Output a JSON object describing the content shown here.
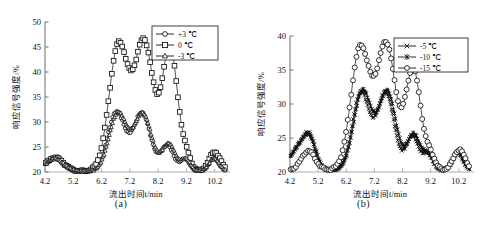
{
  "figure": {
    "panels": [
      {
        "id": "a",
        "caption": "(a)",
        "xlabel": "流出时间t/min",
        "ylabel": "响应信号强度/%",
        "xticks": [
          "4.2",
          "5.2",
          "6.2",
          "7.2",
          "8.2",
          "9.2",
          "10.2"
        ],
        "yticks": [
          "20",
          "25",
          "30",
          "35",
          "40",
          "45",
          "50"
        ],
        "legend": [
          {
            "label": "+3 ℃",
            "marker": "circle"
          },
          {
            "label": "0 ℃",
            "marker": "square"
          },
          {
            "label": "-3 ℃",
            "marker": "triangle"
          }
        ]
      },
      {
        "id": "b",
        "caption": "(b)",
        "xlabel": "流出时间t/min",
        "ylabel": "响应信号强度/%",
        "xticks": [
          "4.2",
          "5.2",
          "6.2",
          "7.2",
          "8.2",
          "9.2",
          "10.2"
        ],
        "yticks": [
          "20",
          "25",
          "30",
          "35",
          "40"
        ],
        "legend": [
          {
            "label": "-5 ℃",
            "marker": "cross"
          },
          {
            "label": "-10 ℃",
            "marker": "star"
          },
          {
            "label": "-15 ℃",
            "marker": "circle"
          }
        ]
      }
    ]
  },
  "chart_data": [
    {
      "type": "line",
      "panel": "(a)",
      "title": "",
      "xlabel": "流出时间t/min",
      "ylabel": "响应信号强度/%",
      "xlim": [
        4.2,
        10.6
      ],
      "ylim": [
        20,
        50
      ],
      "xticks": [
        4.2,
        5.2,
        6.2,
        7.2,
        8.2,
        9.2,
        10.2
      ],
      "yticks": [
        20,
        25,
        30,
        35,
        40,
        45,
        50
      ],
      "grid": false,
      "legend_position": "top-right",
      "baseline": 20.2,
      "series": [
        {
          "name": "+3 ℃",
          "marker": "circle",
          "peaks": [
            {
              "center": 6.72,
              "height": 11.8,
              "width": 0.3
            },
            {
              "center": 7.62,
              "height": 11.6,
              "width": 0.3
            },
            {
              "center": 8.52,
              "height": 5.1,
              "width": 0.22
            }
          ],
          "bumps": [
            {
              "center": 4.55,
              "height": 2.6,
              "width": 0.3
            },
            {
              "center": 9.15,
              "height": 2.4,
              "width": 0.16
            },
            {
              "center": 10.15,
              "height": 2.6,
              "width": 0.18
            }
          ]
        },
        {
          "name": "0 ℃",
          "marker": "square",
          "peaks": [
            {
              "center": 6.8,
              "height": 25.2,
              "width": 0.33
            },
            {
              "center": 7.7,
              "height": 25.8,
              "width": 0.33
            },
            {
              "center": 8.62,
              "height": 24.6,
              "width": 0.27
            }
          ],
          "bumps": [
            {
              "center": 4.55,
              "height": 2.7,
              "width": 0.3
            },
            {
              "center": 9.2,
              "height": 2.5,
              "width": 0.16
            },
            {
              "center": 10.2,
              "height": 3.8,
              "width": 0.2
            }
          ]
        },
        {
          "name": "-3 ℃",
          "marker": "triangle",
          "peaks": [
            {
              "center": 6.78,
              "height": 11.6,
              "width": 0.31
            },
            {
              "center": 7.66,
              "height": 11.4,
              "width": 0.31
            },
            {
              "center": 8.58,
              "height": 5.4,
              "width": 0.23
            }
          ],
          "bumps": [
            {
              "center": 4.55,
              "height": 2.5,
              "width": 0.3
            },
            {
              "center": 9.18,
              "height": 2.3,
              "width": 0.16
            },
            {
              "center": 10.18,
              "height": 2.5,
              "width": 0.18
            }
          ]
        }
      ]
    },
    {
      "type": "line",
      "panel": "(b)",
      "title": "",
      "xlabel": "流出时间t/min",
      "ylabel": "响应信号强度/%",
      "xlim": [
        4.2,
        10.6
      ],
      "ylim": [
        20,
        40
      ],
      "xticks": [
        4.2,
        5.2,
        6.2,
        7.2,
        8.2,
        9.2,
        10.2
      ],
      "yticks": [
        20,
        25,
        30,
        35,
        40
      ],
      "grid": false,
      "legend_position": "top-right",
      "baseline": 20.3,
      "series": [
        {
          "name": "-5 ℃",
          "marker": "cross",
          "peaks": [
            {
              "center": 6.72,
              "height": 11.4,
              "width": 0.3
            },
            {
              "center": 7.6,
              "height": 11.3,
              "width": 0.3
            },
            {
              "center": 8.55,
              "height": 5.0,
              "width": 0.22
            }
          ],
          "bumps": [
            {
              "center": 4.9,
              "height": 4.8,
              "width": 0.22
            },
            {
              "center": 4.45,
              "height": 2.9,
              "width": 0.26
            },
            {
              "center": 9.1,
              "height": 2.3,
              "width": 0.17
            },
            {
              "center": 10.15,
              "height": 2.5,
              "width": 0.18
            }
          ]
        },
        {
          "name": "-10 ℃",
          "marker": "star",
          "peaks": [
            {
              "center": 6.78,
              "height": 11.6,
              "width": 0.31
            },
            {
              "center": 7.66,
              "height": 11.5,
              "width": 0.31
            },
            {
              "center": 8.6,
              "height": 5.2,
              "width": 0.23
            }
          ],
          "bumps": [
            {
              "center": 4.88,
              "height": 4.5,
              "width": 0.22
            },
            {
              "center": 4.45,
              "height": 2.8,
              "width": 0.26
            },
            {
              "center": 9.12,
              "height": 2.2,
              "width": 0.17
            },
            {
              "center": 10.18,
              "height": 2.6,
              "width": 0.18
            }
          ]
        },
        {
          "name": "-15 ℃",
          "marker": "circle",
          "peaks": [
            {
              "center": 6.7,
              "height": 18.0,
              "width": 0.33
            },
            {
              "center": 7.62,
              "height": 18.5,
              "width": 0.33
            },
            {
              "center": 8.58,
              "height": 14.8,
              "width": 0.27
            }
          ],
          "bumps": [
            {
              "center": 4.85,
              "height": 2.8,
              "width": 0.24
            },
            {
              "center": 9.2,
              "height": 2.0,
              "width": 0.16
            },
            {
              "center": 10.22,
              "height": 3.0,
              "width": 0.2
            }
          ]
        }
      ]
    }
  ]
}
